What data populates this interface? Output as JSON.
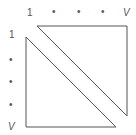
{
  "diagram": {
    "top_axis": {
      "labels": [
        "1",
        "•",
        "•",
        "•",
        "V"
      ]
    },
    "left_axis": {
      "labels": [
        "1",
        "•",
        "•",
        "•",
        "V"
      ]
    },
    "shapes": [
      {
        "name": "upper-triangle",
        "points": "37,26 127,26 127,116"
      },
      {
        "name": "lower-triangle",
        "points": "26,37 26,127 116,127"
      }
    ],
    "colors": {
      "stroke": "#555555",
      "background": "#ffffff"
    }
  }
}
